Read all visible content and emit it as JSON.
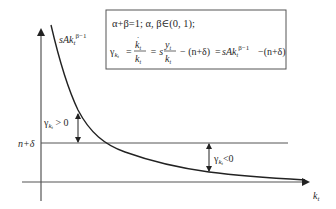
{
  "figure": {
    "type": "growth-rate diagram (Solow model, capital per worker)",
    "colors": {
      "background": "#ffffff",
      "line": "#333333",
      "axis": "#555555",
      "box_border": "#555555"
    }
  },
  "axes": {
    "x_label_main": "k",
    "x_label_sub": "t",
    "y_axis_has_arrow": true,
    "x_axis_has_arrow": true
  },
  "curve": {
    "label_prefix": "sAk",
    "label_sub": "t",
    "label_sup": "β−1"
  },
  "threshold_line": {
    "label": "n+δ"
  },
  "annotations": {
    "positive": {
      "gamma": "γ",
      "sub": "k",
      "subsub": "t",
      "relation": " > 0"
    },
    "negative": {
      "gamma": "γ",
      "sub": "k",
      "subsub": "t",
      "relation": "<0"
    }
  },
  "formula_box": {
    "line1": "α+β=1; α, β∈(0, 1);",
    "line2": {
      "gamma": "γ",
      "gamma_sub": "k",
      "gamma_subsub": "t",
      "eq1": "=",
      "frac1_num": "k",
      "frac1_num_dot": "˙",
      "frac1_num_sub": "t",
      "frac1_den": "k",
      "frac1_den_sub": "t",
      "eq2": "= s",
      "frac2_num": "y",
      "frac2_num_sub": "t",
      "frac2_den": "k",
      "frac2_den_sub": "t",
      "minus_term": "− (n+δ)",
      "eq3": "=",
      "rhs_prefix": "sAk",
      "rhs_sub": "t",
      "rhs_sup": "β−1",
      "rhs_tail": "−(n+δ)"
    }
  }
}
